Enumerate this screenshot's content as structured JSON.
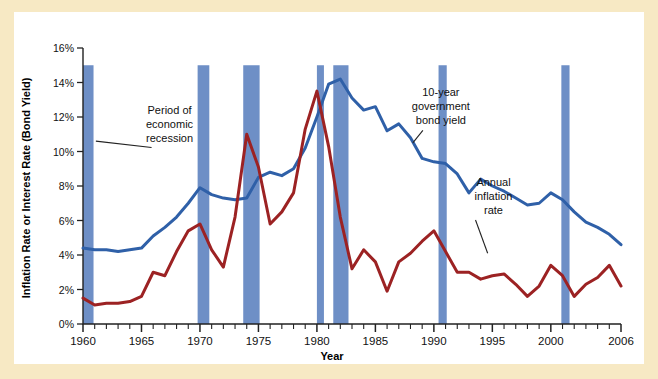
{
  "figure": {
    "background_color": "#f7e9c4",
    "panel_color": "#ffffff"
  },
  "chart_data": {
    "type": "line",
    "title": "",
    "xlabel": "Year",
    "ylabel": "Inflation Rate or Interest Rate (Bond Yield)",
    "xlim": [
      1960,
      2006
    ],
    "ylim": [
      0,
      16
    ],
    "grid": false,
    "legend": "annotations",
    "x_ticks_major": [
      1960,
      1965,
      1970,
      1975,
      1980,
      1985,
      1990,
      1995,
      2000,
      2006
    ],
    "x_tick_labels": [
      "1960",
      "1965",
      "1970",
      "1975",
      "1980",
      "1985",
      "1990",
      "1995",
      "2000",
      "2006"
    ],
    "x_ticks_minor_step": 1,
    "y_ticks": [
      0,
      2,
      4,
      6,
      8,
      10,
      12,
      14,
      16
    ],
    "y_tick_labels": [
      "0%",
      "2%",
      "4%",
      "6%",
      "8%",
      "10%",
      "12%",
      "14%",
      "16%"
    ],
    "x": [
      1960,
      1961,
      1962,
      1963,
      1964,
      1965,
      1966,
      1967,
      1968,
      1969,
      1970,
      1971,
      1972,
      1973,
      1974,
      1975,
      1976,
      1977,
      1978,
      1979,
      1980,
      1981,
      1982,
      1983,
      1984,
      1985,
      1986,
      1987,
      1988,
      1989,
      1990,
      1991,
      1992,
      1993,
      1994,
      1995,
      1996,
      1997,
      1998,
      1999,
      2000,
      2001,
      2002,
      2003,
      2004,
      2005,
      2006
    ],
    "series": [
      {
        "name": "10-year government bond yield",
        "color": "#2f60a8",
        "values": [
          4.4,
          4.3,
          4.3,
          4.2,
          4.3,
          4.4,
          5.1,
          5.6,
          6.2,
          7.0,
          7.9,
          7.5,
          7.3,
          7.2,
          7.3,
          8.5,
          8.8,
          8.6,
          9.0,
          10.2,
          12.0,
          13.9,
          14.2,
          13.1,
          12.4,
          12.6,
          11.2,
          11.6,
          10.8,
          9.6,
          9.4,
          9.3,
          8.7,
          7.6,
          8.4,
          8.0,
          7.7,
          7.3,
          6.9,
          7.0,
          7.6,
          7.2,
          6.5,
          5.9,
          5.6,
          5.2,
          4.6
        ],
        "annotation": {
          "text_lines": [
            "10-year",
            "government",
            "bond yield"
          ],
          "x_year": 1990.6,
          "y_value": 13.2,
          "leader_to": {
            "x_year": 1988.2,
            "y_value": 10.5
          }
        }
      },
      {
        "name": "Annual inflation rate",
        "color": "#9c2223",
        "values": [
          1.5,
          1.1,
          1.2,
          1.2,
          1.3,
          1.6,
          3.0,
          2.8,
          4.2,
          5.4,
          5.8,
          4.3,
          3.3,
          6.2,
          11.0,
          9.1,
          5.8,
          6.5,
          7.6,
          11.3,
          13.5,
          10.3,
          6.2,
          3.2,
          4.3,
          3.6,
          1.9,
          3.6,
          4.1,
          4.8,
          5.4,
          4.2,
          3.0,
          3.0,
          2.6,
          2.8,
          2.9,
          2.3,
          1.6,
          2.2,
          3.4,
          2.8,
          1.6,
          2.3,
          2.7,
          3.4,
          2.2
        ],
        "annotation": {
          "text_lines": [
            "Annual",
            "inflation",
            "rate"
          ],
          "x_year": 1995.1,
          "y_value": 8.0,
          "leader_to": {
            "x_year": 1994.6,
            "y_value": 4.1
          }
        }
      }
    ],
    "recession_bands": [
      {
        "start": 1960.0,
        "end": 1960.9
      },
      {
        "start": 1969.8,
        "end": 1970.8
      },
      {
        "start": 1973.7,
        "end": 1975.1
      },
      {
        "start": 1980.0,
        "end": 1980.6
      },
      {
        "start": 1981.4,
        "end": 1982.7
      },
      {
        "start": 1990.4,
        "end": 1991.1
      },
      {
        "start": 2000.9,
        "end": 2001.6
      }
    ],
    "recession_band_color": "#6e8fc6",
    "recession_band_top_value": 15.0,
    "annotations": [
      {
        "name": "recession-annotation",
        "text_lines": [
          "Period of",
          "economic",
          "recession"
        ],
        "x_year": 1967.4,
        "y_value": 12.2,
        "leader_to": {
          "x_year": 1961.1,
          "y_value": 10.6
        }
      }
    ]
  }
}
